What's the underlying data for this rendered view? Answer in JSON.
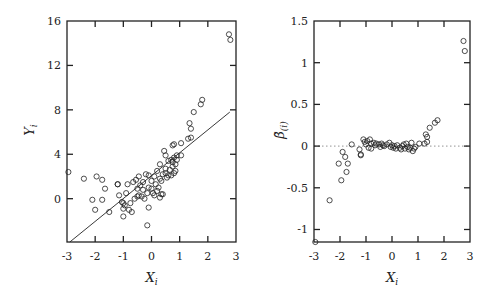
{
  "chart_data": [
    {
      "type": "scatter",
      "title": "",
      "xlabel": "X_i",
      "ylabel": "Y_i",
      "xlim": [
        -3,
        3
      ],
      "ylim": [
        -3.9,
        16
      ],
      "xticks": [
        -3,
        -2,
        -1,
        0,
        1,
        2,
        3
      ],
      "yticks": [
        0,
        4,
        8,
        12,
        16
      ],
      "xtick_labels": [
        "-3",
        "-2",
        "-1",
        "0",
        "1",
        "2",
        "3"
      ],
      "ytick_labels": [
        "0",
        "4",
        "8",
        "12",
        "16"
      ],
      "grid": false,
      "legend": null,
      "fit_line": {
        "x": [
          -2.9,
          2.78
        ],
        "y": [
          -3.9,
          7.8
        ]
      },
      "points": [
        [
          -2.95,
          2.4
        ],
        [
          -2.4,
          1.8
        ],
        [
          -2.1,
          -0.1
        ],
        [
          -2.0,
          -1.0
        ],
        [
          -1.95,
          2.0
        ],
        [
          -1.75,
          1.7
        ],
        [
          -1.75,
          -0.1
        ],
        [
          -1.65,
          0.9
        ],
        [
          -1.5,
          -1.2
        ],
        [
          -1.2,
          1.3
        ],
        [
          -1.2,
          1.3
        ],
        [
          -1.15,
          0.3
        ],
        [
          -1.05,
          -0.3
        ],
        [
          -1.0,
          -0.4
        ],
        [
          -1.0,
          -0.9
        ],
        [
          -1.0,
          -1.6
        ],
        [
          -0.95,
          -0.6
        ],
        [
          -0.9,
          0.5
        ],
        [
          -0.85,
          1.3
        ],
        [
          -0.8,
          -1.0
        ],
        [
          -0.75,
          -0.4
        ],
        [
          -0.7,
          -1.2
        ],
        [
          -0.65,
          1.5
        ],
        [
          -0.6,
          0.0
        ],
        [
          -0.55,
          1.7
        ],
        [
          -0.5,
          0.2
        ],
        [
          -0.5,
          0.9
        ],
        [
          -0.45,
          2.0
        ],
        [
          -0.45,
          0.3
        ],
        [
          -0.4,
          1.2
        ],
        [
          -0.35,
          0.2
        ],
        [
          -0.3,
          0.8
        ],
        [
          -0.3,
          1.5
        ],
        [
          -0.25,
          0.0
        ],
        [
          -0.2,
          2.2
        ],
        [
          -0.15,
          0.5
        ],
        [
          -0.1,
          1.0
        ],
        [
          -0.1,
          2.1
        ],
        [
          -0.1,
          -0.8
        ],
        [
          -0.15,
          -2.4
        ],
        [
          0.0,
          0.9
        ],
        [
          0.0,
          1.6
        ],
        [
          0.05,
          0.5
        ],
        [
          0.1,
          2.0
        ],
        [
          0.1,
          0.3
        ],
        [
          0.15,
          1.3
        ],
        [
          0.2,
          2.5
        ],
        [
          0.2,
          0.7
        ],
        [
          0.25,
          1.0
        ],
        [
          0.3,
          1.8
        ],
        [
          0.3,
          0.1
        ],
        [
          0.3,
          3.1
        ],
        [
          0.35,
          0.4
        ],
        [
          0.35,
          1.6
        ],
        [
          0.4,
          2.2
        ],
        [
          0.4,
          0.4
        ],
        [
          0.45,
          4.3
        ],
        [
          0.5,
          3.9
        ],
        [
          0.5,
          2.7
        ],
        [
          0.5,
          2.3
        ],
        [
          0.55,
          1.9
        ],
        [
          0.6,
          2.1
        ],
        [
          0.6,
          3.4
        ],
        [
          0.65,
          2.6
        ],
        [
          0.7,
          3.5
        ],
        [
          0.7,
          2.1
        ],
        [
          0.75,
          2.9
        ],
        [
          0.75,
          3.3
        ],
        [
          0.8,
          3.7
        ],
        [
          0.8,
          2.3
        ],
        [
          0.85,
          3.1
        ],
        [
          0.85,
          2.5
        ],
        [
          0.9,
          3.5
        ],
        [
          0.9,
          3.9
        ],
        [
          0.75,
          4.8
        ],
        [
          0.8,
          4.9
        ],
        [
          1.05,
          5.0
        ],
        [
          1.05,
          3.9
        ],
        [
          1.3,
          5.4
        ],
        [
          1.35,
          6.8
        ],
        [
          1.4,
          5.5
        ],
        [
          1.4,
          6.3
        ],
        [
          1.5,
          7.8
        ],
        [
          1.75,
          8.5
        ],
        [
          1.8,
          8.9
        ],
        [
          2.75,
          14.8
        ],
        [
          2.8,
          14.3
        ]
      ]
    },
    {
      "type": "scatter",
      "title": "",
      "xlabel": "X_i",
      "ylabel": "β̃_(i)",
      "xlim": [
        -3,
        3
      ],
      "ylim": [
        -1.15,
        1.5
      ],
      "xticks": [
        -3,
        -2,
        -1,
        0,
        1,
        2,
        3
      ],
      "yticks": [
        -1,
        -0.5,
        0,
        0.5,
        1,
        1.5
      ],
      "xtick_labels": [
        "-3",
        "-2",
        "-1",
        "0",
        "1",
        "2",
        "3"
      ],
      "ytick_labels": [
        "-1",
        "-0.5",
        "0",
        "0.5",
        "1",
        "1.5"
      ],
      "grid": false,
      "legend": null,
      "reference_line": {
        "y": 0,
        "style": "dotted"
      },
      "points": [
        [
          -2.95,
          -1.15
        ],
        [
          -2.4,
          -0.65
        ],
        [
          -2.05,
          -0.21
        ],
        [
          -1.95,
          -0.41
        ],
        [
          -1.9,
          -0.07
        ],
        [
          -1.8,
          -0.13
        ],
        [
          -1.75,
          -0.31
        ],
        [
          -1.7,
          -0.21
        ],
        [
          -1.55,
          0.02
        ],
        [
          -1.25,
          -0.04
        ],
        [
          -1.2,
          -0.1
        ],
        [
          -1.2,
          -0.11
        ],
        [
          -1.1,
          0.08
        ],
        [
          -1.05,
          0.05
        ],
        [
          -1.0,
          0.02
        ],
        [
          -0.95,
          0.06
        ],
        [
          -0.9,
          -0.02
        ],
        [
          -0.85,
          0.08
        ],
        [
          -0.8,
          0.03
        ],
        [
          -0.8,
          -0.03
        ],
        [
          -0.7,
          0.04
        ],
        [
          -0.65,
          0.01
        ],
        [
          -0.6,
          0.03
        ],
        [
          -0.5,
          0.02
        ],
        [
          -0.45,
          -0.01
        ],
        [
          -0.4,
          0.03
        ],
        [
          -0.35,
          0.01
        ],
        [
          -0.3,
          0.0
        ],
        [
          -0.2,
          0.02
        ],
        [
          -0.1,
          0.04
        ],
        [
          -0.05,
          -0.01
        ],
        [
          0.0,
          0.01
        ],
        [
          0.05,
          -0.02
        ],
        [
          0.1,
          0.0
        ],
        [
          0.15,
          -0.03
        ],
        [
          0.2,
          0.01
        ],
        [
          0.3,
          -0.02
        ],
        [
          0.35,
          -0.04
        ],
        [
          0.4,
          0.0
        ],
        [
          0.45,
          0.02
        ],
        [
          0.5,
          -0.03
        ],
        [
          0.55,
          0.03
        ],
        [
          0.6,
          -0.01
        ],
        [
          0.65,
          -0.04
        ],
        [
          0.7,
          -0.02
        ],
        [
          0.75,
          0.04
        ],
        [
          0.8,
          -0.06
        ],
        [
          0.85,
          -0.03
        ],
        [
          0.9,
          -0.01
        ],
        [
          1.05,
          0.03
        ],
        [
          1.25,
          0.03
        ],
        [
          1.3,
          0.14
        ],
        [
          1.35,
          0.11
        ],
        [
          1.35,
          0.05
        ],
        [
          1.45,
          0.22
        ],
        [
          1.65,
          0.28
        ],
        [
          1.75,
          0.31
        ],
        [
          2.75,
          1.26
        ],
        [
          2.8,
          1.14
        ]
      ]
    }
  ]
}
